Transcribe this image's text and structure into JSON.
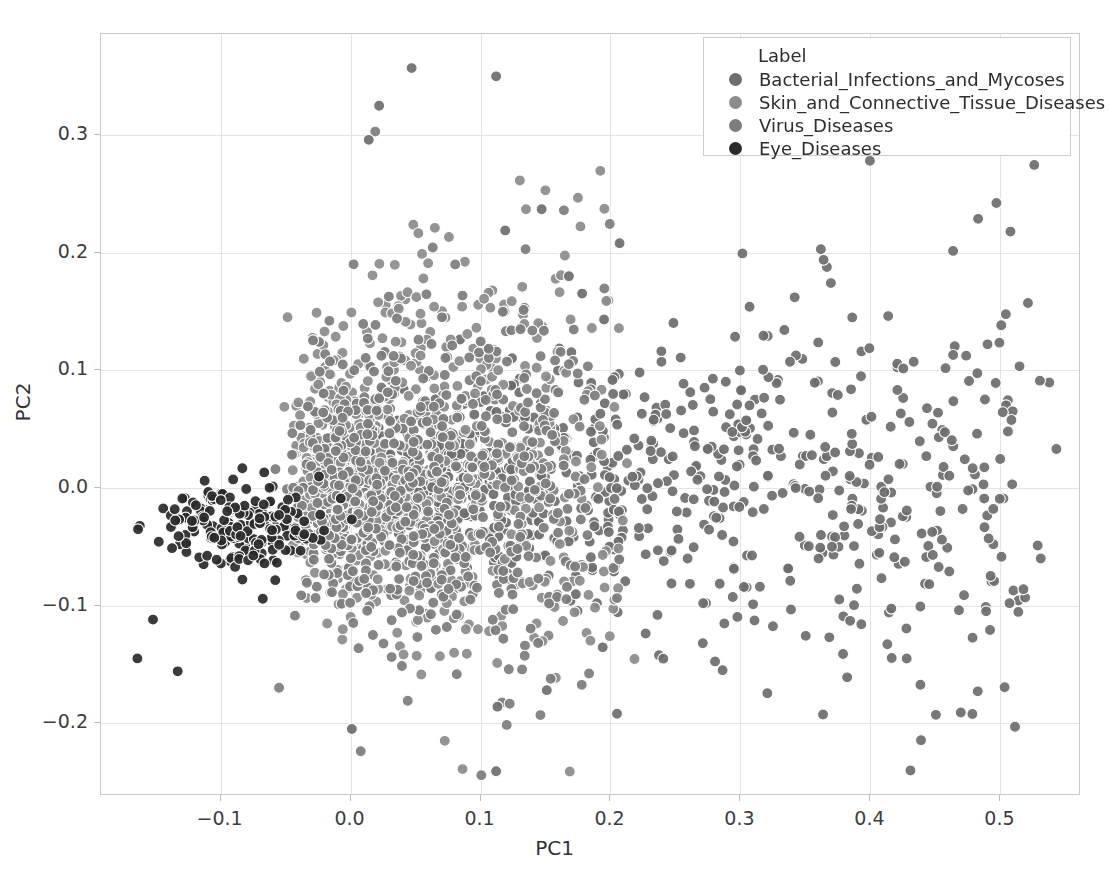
{
  "chart_data": {
    "type": "scatter",
    "title": "",
    "xlabel": "PC1",
    "ylabel": "PC2",
    "xlim": [
      -0.192,
      0.562
    ],
    "ylim": [
      -0.262,
      0.386
    ],
    "xticks": [
      -0.1,
      0.0,
      0.1,
      0.2,
      0.3,
      0.4,
      0.5
    ],
    "xtick_labels": [
      "−0.1",
      "0.0",
      "0.1",
      "0.2",
      "0.3",
      "0.4",
      "0.5"
    ],
    "yticks": [
      -0.2,
      -0.1,
      0.0,
      0.1,
      0.2,
      0.3
    ],
    "ytick_labels": [
      "−0.2",
      "−0.1",
      "0.0",
      "0.1",
      "0.2",
      "0.3"
    ],
    "grid": true,
    "legend_position": "upper right",
    "legend_title": "Label",
    "marker_size_px": 11,
    "marker_edge_color": "#ffffff",
    "series": [
      {
        "name": "Bacterial_Infections_and_Mycoses",
        "color": "#6e6e6e",
        "n": 900,
        "cluster": {
          "cx": 0.055,
          "cy": 0.005,
          "sx": 0.105,
          "sy": 0.062,
          "skew_x": 0.85,
          "spread": "fan-right"
        }
      },
      {
        "name": "Skin_and_Connective_Tissue_Diseases",
        "color": "#8c8c8c",
        "n": 760,
        "cluster": {
          "cx": 0.005,
          "cy": 0.01,
          "sx": 0.05,
          "sy": 0.072,
          "skew_x": 0.45,
          "spread": "core-vertical"
        }
      },
      {
        "name": "Virus_Diseases",
        "color": "#7d7d7d",
        "n": 640,
        "cluster": {
          "cx": 0.01,
          "cy": 0.0,
          "sx": 0.06,
          "sy": 0.07,
          "skew_x": 0.5,
          "spread": "core"
        }
      },
      {
        "name": "Eye_Diseases",
        "color": "#2b2b2b",
        "n": 190,
        "cluster": {
          "cx": -0.072,
          "cy": -0.045,
          "sx": 0.042,
          "sy": 0.048,
          "skew_x": 0.2,
          "spread": "left-tail"
        }
      }
    ]
  },
  "legend": {
    "title": "Label",
    "entries": [
      {
        "label": "Bacterial_Infections_and_Mycoses",
        "color": "#6e6e6e"
      },
      {
        "label": "Skin_and_Connective_Tissue_Diseases",
        "color": "#8c8c8c"
      },
      {
        "label": "Virus_Diseases",
        "color": "#7d7d7d"
      },
      {
        "label": "Eye_Diseases",
        "color": "#2b2b2b"
      }
    ]
  },
  "axes": {
    "x_label": "PC1",
    "y_label": "PC2",
    "frame_color": "#c9c9c9",
    "grid_color": "#e3e3e3"
  }
}
